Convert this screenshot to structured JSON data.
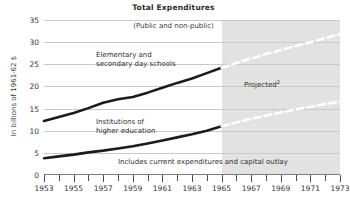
{
  "chart_data": {
    "type": "line",
    "title": "Total Expenditures",
    "subtitle": "(Public and non-public)",
    "xlabel": "",
    "ylabel": "In billions of 1961-62 $",
    "xlim": [
      1953,
      1973
    ],
    "ylim": [
      0,
      35
    ],
    "yticks": [
      0,
      5,
      10,
      15,
      20,
      25,
      30,
      35
    ],
    "xticks": [
      1953,
      1954,
      1955,
      1956,
      1957,
      1958,
      1959,
      1960,
      1961,
      1962,
      1963,
      1964,
      1965,
      1966,
      1967,
      1968,
      1969,
      1970,
      1971,
      1972,
      1973
    ],
    "xtick_labels": [
      "1953",
      "1955",
      "1957",
      "1959",
      "1961",
      "1963",
      "1965",
      "1967",
      "1969",
      "1971",
      "1973"
    ],
    "grid": "horizontal",
    "legend": "none",
    "projection_start": 1965,
    "series": [
      {
        "name": "Elementary and secondary day schools",
        "x": [
          1953,
          1954,
          1955,
          1956,
          1957,
          1958,
          1959,
          1960,
          1961,
          1962,
          1963,
          1964,
          1965
        ],
        "values": [
          12.2,
          13.1,
          14.0,
          15.1,
          16.3,
          17.1,
          17.6,
          18.6,
          19.7,
          20.8,
          21.8,
          23.0,
          24.2
        ],
        "style": "solid-black"
      },
      {
        "name": "Elementary and secondary day schools (projected)",
        "x": [
          1965,
          1966,
          1967,
          1968,
          1969,
          1970,
          1971,
          1972,
          1973
        ],
        "values": [
          24.2,
          25.3,
          26.3,
          27.3,
          28.2,
          29.1,
          30.0,
          30.9,
          31.8
        ],
        "style": "dashed-white"
      },
      {
        "name": "Institutions of higher education",
        "x": [
          1953,
          1954,
          1955,
          1956,
          1957,
          1958,
          1959,
          1960,
          1961,
          1962,
          1963,
          1964,
          1965
        ],
        "values": [
          3.8,
          4.2,
          4.6,
          5.1,
          5.5,
          6.0,
          6.5,
          7.1,
          7.8,
          8.5,
          9.2,
          10.0,
          11.0
        ],
        "style": "solid-black"
      },
      {
        "name": "Institutions of higher education (projected)",
        "x": [
          1965,
          1966,
          1967,
          1968,
          1969,
          1970,
          1971,
          1972,
          1973
        ],
        "values": [
          11.0,
          11.9,
          12.7,
          13.4,
          14.1,
          14.8,
          15.4,
          16.0,
          16.6
        ],
        "style": "dashed-white"
      }
    ],
    "annotations": [
      {
        "id": "elem-label",
        "text": "Elementary and\nsecondary day schools"
      },
      {
        "id": "higher-ed-label",
        "text": "Institutions of\nhigher education"
      },
      {
        "id": "projected-label",
        "text": "Projected",
        "footnote": "2"
      },
      {
        "id": "footnote-note",
        "text": "Includes current expenditures and capital outlay"
      }
    ]
  }
}
